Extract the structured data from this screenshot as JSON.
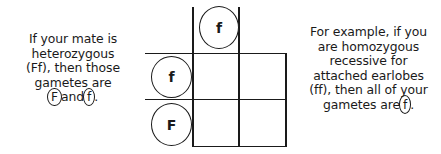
{
  "diagram": {
    "type": "punnett-square"
  },
  "left_text": {
    "lines": [
      "If your mate is",
      "heterozygous",
      "(Ff), then those",
      "gametes are"
    ],
    "final_line": {
      "allele_1": "F",
      "connector": "and",
      "allele_2": "f",
      "period": "."
    }
  },
  "right_text": {
    "lines": [
      "For example, if you",
      "are homozygous",
      "recessive for",
      "attached earlobes",
      "(ff), then all of your"
    ],
    "final_line": {
      "prefix": "gametes are",
      "allele": "f",
      "period": "."
    }
  },
  "grid": {
    "top_gamete": "f",
    "left_gametes": [
      "f",
      "F"
    ],
    "cells": [
      [
        "",
        ""
      ],
      [
        "",
        ""
      ]
    ],
    "line_color": "#1a1a1a"
  },
  "colors": {
    "background": "#ffffff",
    "ink": "#1a1a1a"
  }
}
